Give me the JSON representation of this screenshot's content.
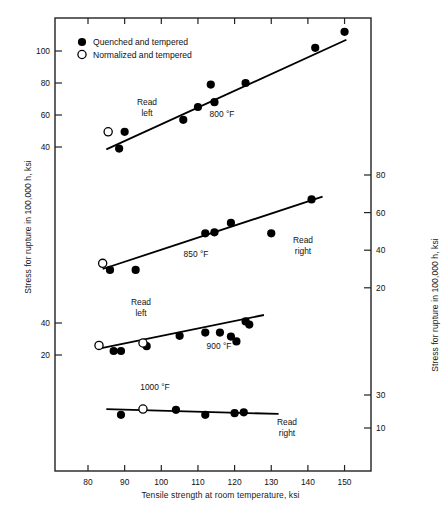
{
  "chart_data": {
    "type": "scatter",
    "title": "",
    "xlabel": "Tensile strength at room temperature, ksi",
    "ylabel_left": "Stress for rupture in 100,000 h, ksi",
    "ylabel_right": "Stress for rupture in 100,000 h, ksi",
    "xlim": [
      74,
      158
    ],
    "xticks": [
      80,
      90,
      100,
      110,
      120,
      130,
      140,
      150
    ],
    "grid": false,
    "legend_position": "upper-left",
    "legend": [
      {
        "marker": "filled-circle",
        "label": "Quenched and tempered"
      },
      {
        "marker": "open-circle",
        "label": "Normalized and tempered"
      }
    ],
    "axes": [
      {
        "name": "left-upper",
        "side": "left",
        "ticks": [
          40,
          60,
          80,
          100
        ],
        "applies_to": [
          "800 °F"
        ]
      },
      {
        "name": "left-lower",
        "side": "left",
        "ticks": [
          20,
          40
        ],
        "applies_to": [
          "900 °F"
        ]
      },
      {
        "name": "right-upper",
        "side": "right",
        "ticks": [
          20,
          40,
          60,
          80
        ],
        "applies_to": [
          "850 °F"
        ]
      },
      {
        "name": "right-lower",
        "side": "right",
        "ticks": [
          10,
          30
        ],
        "applies_to": [
          "1000 °F"
        ]
      }
    ],
    "annotations": [
      {
        "text": "Read",
        "sub": "left",
        "series": "800 °F"
      },
      {
        "text": "Read",
        "sub": "right",
        "series": "850 °F"
      },
      {
        "text": "Read",
        "sub": "left",
        "series": "900 °F"
      },
      {
        "text": "Read",
        "sub": "right",
        "series": "1000 °F"
      }
    ],
    "series": [
      {
        "name": "800 °F",
        "label": "800 °F",
        "read_axis": "left-upper",
        "fit_line": {
          "x1": 85.0,
          "y1": 38.5,
          "x2": 150.5,
          "y2": 107.0
        },
        "points_filled": [
          {
            "x": 88.5,
            "y": 39.0
          },
          {
            "x": 90.0,
            "y": 49.5
          },
          {
            "x": 106.0,
            "y": 57.0
          },
          {
            "x": 110.0,
            "y": 65.0
          },
          {
            "x": 113.5,
            "y": 79.0
          },
          {
            "x": 114.5,
            "y": 68.0
          },
          {
            "x": 123.0,
            "y": 80.0
          },
          {
            "x": 142.0,
            "y": 102.0
          },
          {
            "x": 150.0,
            "y": 112.0
          }
        ],
        "points_open": [
          {
            "x": 85.5,
            "y": 49.5
          }
        ]
      },
      {
        "name": "850 °F",
        "label": "850 °F",
        "read_axis": "right-upper",
        "fit_line": {
          "x1": 84.0,
          "y1": 30.0,
          "x2": 144.0,
          "y2": 68.5
        },
        "points_filled": [
          {
            "x": 86.0,
            "y": 29.5
          },
          {
            "x": 93.0,
            "y": 29.5
          },
          {
            "x": 112.0,
            "y": 49.0
          },
          {
            "x": 114.5,
            "y": 49.5
          },
          {
            "x": 119.0,
            "y": 54.5
          },
          {
            "x": 130.0,
            "y": 49.0
          },
          {
            "x": 141.0,
            "y": 67.0
          }
        ],
        "points_open": [
          {
            "x": 84.0,
            "y": 33.0
          }
        ]
      },
      {
        "name": "900 °F",
        "label": "900 °F",
        "read_axis": "left-lower",
        "fit_line": {
          "x1": 83.0,
          "y1": 24.0,
          "x2": 128.0,
          "y2": 45.0
        },
        "points_filled": [
          {
            "x": 87.0,
            "y": 22.5
          },
          {
            "x": 89.0,
            "y": 22.5
          },
          {
            "x": 96.0,
            "y": 25.5
          },
          {
            "x": 105.0,
            "y": 32.0
          },
          {
            "x": 112.0,
            "y": 34.0
          },
          {
            "x": 116.0,
            "y": 34.0
          },
          {
            "x": 119.0,
            "y": 31.5
          },
          {
            "x": 120.5,
            "y": 28.5
          },
          {
            "x": 123.0,
            "y": 41.0
          },
          {
            "x": 124.0,
            "y": 39.0
          }
        ],
        "points_open": [
          {
            "x": 83.0,
            "y": 26.0
          },
          {
            "x": 95.0,
            "y": 27.5
          }
        ]
      },
      {
        "name": "1000 °F",
        "label": "1000 °F",
        "read_axis": "right-lower",
        "fit_line": {
          "x1": 85.0,
          "y1": 21.5,
          "x2": 132.0,
          "y2": 18.5
        },
        "points_filled": [
          {
            "x": 89.0,
            "y": 18.0
          },
          {
            "x": 104.0,
            "y": 21.0
          },
          {
            "x": 112.0,
            "y": 18.0
          },
          {
            "x": 120.0,
            "y": 19.0
          },
          {
            "x": 122.5,
            "y": 19.5
          }
        ],
        "points_open": [
          {
            "x": 95.0,
            "y": 21.5
          }
        ]
      }
    ]
  },
  "ticklabels": {
    "x": [
      "80",
      "90",
      "100",
      "110",
      "120",
      "130",
      "140",
      "150"
    ],
    "left_upper": [
      "100",
      "80",
      "60",
      "40"
    ],
    "left_lower": [
      "40",
      "20"
    ],
    "right_upper": [
      "80",
      "60",
      "40",
      "20"
    ],
    "right_lower": [
      "30",
      "10"
    ]
  },
  "legend": {
    "filled_label": "Quenched and tempered",
    "open_label": "Normalized and tempered"
  },
  "annotations": {
    "read": "Read",
    "left": "left",
    "right": "right",
    "t800": "800 °F",
    "t850": "850 °F",
    "t900": "900 °F",
    "t1000": "1000 °F"
  },
  "labels": {
    "x_axis": "Tensile strength at room temperature, ksi",
    "y_axis_left": "Stress for rupture in 100,000 h, ksi",
    "y_axis_right": "Stress for rupture in 100,000 h, ksi"
  },
  "colors": {
    "line": "#000000",
    "marker_fill": "#000000",
    "marker_open_fill": "#ffffff",
    "axis": "#222222",
    "background": "#ffffff"
  }
}
